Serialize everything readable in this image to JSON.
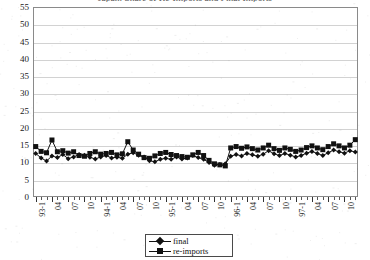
{
  "chart_data": {
    "type": "line",
    "title": "Japan: Share of Re-Imports and Final Imports",
    "xlabel": "",
    "ylabel": "",
    "ylim": [
      0,
      55
    ],
    "ytick_step": 5,
    "yticks": [
      0,
      5,
      10,
      15,
      20,
      25,
      30,
      35,
      40,
      45,
      50,
      55
    ],
    "grid": true,
    "legend_position": "bottom-center",
    "x_tick_interval_months": 1,
    "x_label_interval_months": 3,
    "categories": [
      "93-1",
      "93-2",
      "93-3",
      "04",
      "93-5",
      "93-6",
      "07",
      "93-8",
      "93-9",
      "10",
      "93-11",
      "93-12",
      "94-1",
      "94-2",
      "94-3",
      "04",
      "94-5",
      "94-6",
      "07",
      "94-8",
      "94-9",
      "10",
      "94-11",
      "94-12",
      "95-1",
      "95-2",
      "95-3",
      "04",
      "95-5",
      "95-6",
      "07",
      "95-8",
      "95-9",
      "10",
      "95-11",
      "95-12",
      "96-1",
      "96-2",
      "96-3",
      "04",
      "96-5",
      "96-6",
      "07",
      "96-8",
      "96-9",
      "10",
      "96-11",
      "96-12",
      "97-1",
      "97-2",
      "97-3",
      "04",
      "97-5",
      "97-6",
      "07",
      "97-8",
      "97-9",
      "10",
      "97-11",
      "97-12"
    ],
    "x_labels_visible": [
      {
        "index": 0,
        "text": "93-1"
      },
      {
        "index": 3,
        "text": "04"
      },
      {
        "index": 6,
        "text": "07"
      },
      {
        "index": 9,
        "text": "10"
      },
      {
        "index": 12,
        "text": "94-1"
      },
      {
        "index": 15,
        "text": "04"
      },
      {
        "index": 18,
        "text": "07"
      },
      {
        "index": 21,
        "text": "10"
      },
      {
        "index": 24,
        "text": "95-1"
      },
      {
        "index": 27,
        "text": "04"
      },
      {
        "index": 30,
        "text": "07"
      },
      {
        "index": 33,
        "text": "10"
      },
      {
        "index": 36,
        "text": "96-1"
      },
      {
        "index": 39,
        "text": "04"
      },
      {
        "index": 42,
        "text": "07"
      },
      {
        "index": 45,
        "text": "10"
      },
      {
        "index": 48,
        "text": "97-1"
      },
      {
        "index": 51,
        "text": "04"
      },
      {
        "index": 54,
        "text": "07"
      },
      {
        "index": 57,
        "text": "10"
      }
    ],
    "series": [
      {
        "name": "final",
        "marker": "diamond",
        "color": "#111111",
        "values": [
          12.6,
          11.3,
          10.4,
          11.9,
          11.4,
          12.3,
          11.1,
          11.6,
          12.3,
          12.1,
          11.5,
          11.0,
          11.6,
          12.0,
          11.3,
          11.5,
          11.2,
          12.4,
          12.8,
          12.1,
          11.6,
          10.5,
          10.2,
          10.9,
          11.2,
          10.9,
          11.6,
          11.0,
          11.3,
          12.0,
          11.4,
          10.9,
          10.0,
          9.2,
          9.4,
          9.6,
          11.8,
          12.3,
          11.9,
          12.6,
          12.2,
          11.8,
          12.4,
          13.4,
          12.5,
          12.0,
          12.6,
          12.1,
          11.6,
          12.0,
          12.7,
          13.2,
          12.6,
          12.0,
          12.8,
          13.6,
          13.1,
          12.7,
          13.4,
          13.0
        ]
      },
      {
        "name": "re-imports",
        "marker": "square",
        "color": "#111111",
        "values": [
          14.6,
          13.2,
          12.8,
          16.5,
          13.1,
          13.4,
          12.7,
          13.1,
          12.0,
          11.8,
          12.6,
          13.1,
          12.4,
          12.6,
          12.9,
          12.2,
          12.5,
          16.0,
          13.6,
          12.4,
          11.4,
          11.2,
          11.9,
          12.6,
          12.9,
          12.3,
          12.0,
          11.7,
          11.5,
          12.2,
          12.9,
          12.0,
          10.6,
          9.6,
          9.3,
          9.0,
          14.2,
          14.6,
          14.1,
          14.5,
          14.0,
          13.6,
          14.2,
          15.0,
          14.0,
          13.5,
          14.2,
          13.8,
          13.2,
          13.6,
          14.3,
          14.8,
          14.2,
          13.7,
          14.6,
          15.4,
          14.8,
          14.2,
          15.0,
          16.6
        ]
      }
    ]
  },
  "legend": {
    "items": [
      {
        "label": "final",
        "marker": "diamond"
      },
      {
        "label": "re-imports",
        "marker": "square"
      }
    ]
  }
}
